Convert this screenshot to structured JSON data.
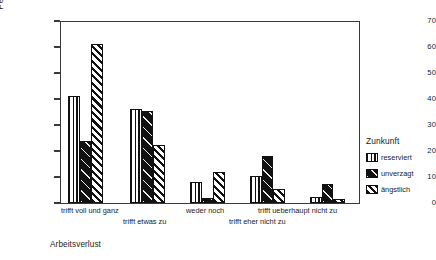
{
  "chart_data": {
    "type": "bar",
    "title": "",
    "xlabel": "",
    "ylabel": "Percent",
    "ylim": [
      0,
      70
    ],
    "yticks": [
      0,
      10,
      20,
      30,
      40,
      50,
      60,
      70
    ],
    "grid": false,
    "legend_position": "right",
    "legend_title": "Zunkunft",
    "categories": [
      "trifft voll und ganz",
      "trifft etwas zu",
      "weder noch",
      "trifft eher nicht zu",
      "trifft ueberhaupt nicht zu"
    ],
    "series": [
      {
        "name": "reserviert",
        "pattern": "vertical-stripes",
        "values": [
          41.3,
          36.0,
          8.0,
          10.5,
          2.5
        ]
      },
      {
        "name": "unverzagt",
        "pattern": "solid-black",
        "values": [
          23.8,
          35.2,
          2.0,
          18.0,
          7.5
        ]
      },
      {
        "name": "ängstlich",
        "pattern": "diagonal-hatch",
        "values": [
          61.0,
          22.2,
          12.0,
          5.5,
          1.5
        ]
      }
    ],
    "caption": "Arbeitsverlust"
  },
  "axis": {
    "y_label": "Percent",
    "tick_labels": [
      "0",
      "10",
      "20",
      "30",
      "40",
      "50",
      "60",
      "70"
    ]
  },
  "legend": {
    "title": "Zunkunft",
    "items": [
      {
        "label": "reserviert"
      },
      {
        "label": "unverzagt"
      },
      {
        "label": "ängstlich"
      }
    ]
  },
  "xaxis": {
    "labels": [
      "trifft voll und ganz",
      "trifft etwas zu",
      "weder noch",
      "trifft eher nicht zu",
      "trifft ueberhaupt nicht zu"
    ]
  },
  "caption": {
    "text": "Arbeitsverlust"
  }
}
